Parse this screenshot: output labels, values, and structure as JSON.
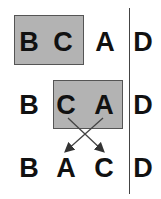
{
  "colors": {
    "box_fill": "#b3b3b3",
    "text": "#111111",
    "line": "#444444"
  },
  "rows": [
    {
      "letters": [
        "B",
        "C",
        "A",
        "D"
      ],
      "highlighted": [
        "B",
        "C"
      ]
    },
    {
      "letters": [
        "B",
        "C",
        "A",
        "D"
      ],
      "highlighted": [
        "C",
        "A"
      ]
    },
    {
      "letters": [
        "B",
        "A",
        "C",
        "D"
      ],
      "highlighted": []
    }
  ],
  "arrows": [
    {
      "from": "C",
      "to": "position-3",
      "icon": "arrow-down-right"
    },
    {
      "from": "A",
      "to": "position-2",
      "icon": "arrow-down-left"
    }
  ]
}
